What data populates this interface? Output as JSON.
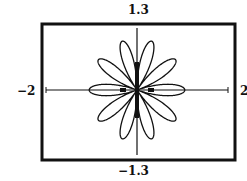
{
  "chart_data": {
    "type": "line",
    "title": "",
    "equation_estimate": "r = |cos(5θ)|",
    "xlabel": "",
    "ylabel": "",
    "xlim": [
      -2,
      2
    ],
    "ylim": [
      -1.3,
      1.3
    ],
    "grid": false,
    "legend": "none",
    "petals": 10,
    "petal_length": 1.0
  },
  "labels": {
    "ymax": "1.3",
    "ymin": "−1.3",
    "xmin": "−2",
    "xmax": "2"
  },
  "colors": {
    "frame": "#111111",
    "curve": "#111111",
    "background": "#ffffff"
  }
}
